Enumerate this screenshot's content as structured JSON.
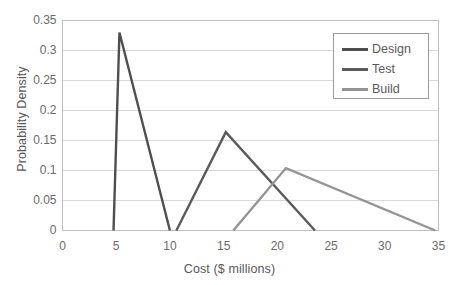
{
  "chart_data": {
    "type": "line",
    "title": "",
    "xlabel": "Cost ($ millions)",
    "ylabel": "Probability Density",
    "xlim": [
      0,
      35
    ],
    "ylim": [
      0,
      0.35
    ],
    "xticks": [
      "0",
      "5",
      "10",
      "15",
      "20",
      "25",
      "30",
      "35"
    ],
    "xtick_values": [
      0,
      5,
      10,
      15,
      20,
      25,
      30,
      35
    ],
    "yticks": [
      "0",
      "0.05",
      "0.1",
      "0.15",
      "0.2",
      "0.25",
      "0.3",
      "0.35"
    ],
    "ytick_values": [
      0,
      0.05,
      0.1,
      0.15,
      0.2,
      0.25,
      0.3,
      0.35
    ],
    "grid": "horizontal",
    "legend_position": "upper-right",
    "series": [
      {
        "name": "Design",
        "color": "#4f4f4f",
        "x": [
          4.75,
          5.3,
          10.0
        ],
        "y": [
          0,
          0.33,
          0
        ]
      },
      {
        "name": "Test",
        "color": "#5a5a5a",
        "x": [
          10.6,
          15.2,
          23.5
        ],
        "y": [
          0,
          0.164,
          0
        ]
      },
      {
        "name": "Build",
        "color": "#949494",
        "x": [
          15.9,
          20.8,
          34.7
        ],
        "y": [
          0,
          0.104,
          0
        ]
      }
    ]
  },
  "legend": {
    "items": [
      {
        "label": "Design"
      },
      {
        "label": "Test"
      },
      {
        "label": "Build"
      }
    ]
  },
  "colors": {
    "design": "#4f4f4f",
    "test": "#5a5a5a",
    "build": "#949494",
    "grid": "#d9d9d9",
    "axis": "#bfbfbf",
    "text": "#595959"
  }
}
